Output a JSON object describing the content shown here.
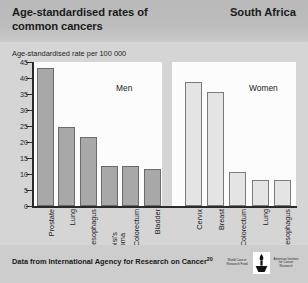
{
  "header": {
    "title": "Age-standardised rates of common cancers",
    "region": "South Africa"
  },
  "axis_caption": "Age-standardised rate per 100 000",
  "footer": {
    "text": "Data from International Agency for Research on Cancer",
    "reference": "20",
    "logo_left": "World Cancer Research Fund",
    "logo_right": "American Institute for Cancer Research"
  },
  "chart_data": {
    "type": "bar",
    "title": "Age-standardised rates of common cancers",
    "subtitle": "South Africa",
    "xlabel": "",
    "ylabel": "Age-standardised rate per 100 000",
    "ylim": [
      0,
      45
    ],
    "yticks": [
      0,
      5,
      10,
      15,
      20,
      25,
      30,
      35,
      40,
      45
    ],
    "grid": false,
    "legend": "none",
    "panels": [
      {
        "name": "Men",
        "bar_color": "#a8a8a8",
        "categories": [
          "Prostate",
          "Lung",
          "Oesophagus",
          "Kapoisi's sarcoma",
          "Colorectum",
          "Bladder"
        ],
        "values": [
          42.5,
          24.0,
          21.0,
          12.0,
          11.8,
          11.0
        ]
      },
      {
        "name": "Women",
        "bar_color": "#e4e4e4",
        "categories": [
          "Cervix",
          "Breast",
          "Colorectum",
          "Lung",
          "Oesophagus"
        ],
        "values": [
          38.0,
          35.0,
          10.0,
          7.5,
          7.5
        ]
      }
    ]
  }
}
